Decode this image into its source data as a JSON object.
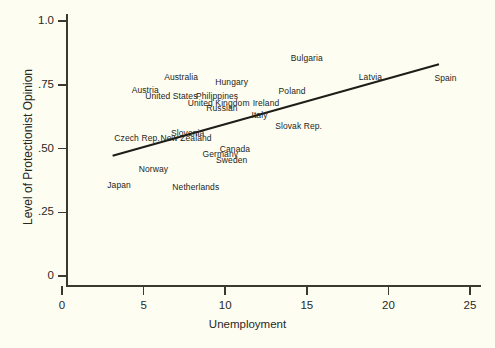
{
  "chart_data": {
    "type": "scatter",
    "title": "",
    "xlabel": "Unemployment",
    "ylabel": "Level of Protectionist Opinion",
    "xlim": [
      0,
      25
    ],
    "ylim": [
      0,
      1.0
    ],
    "xticks": [
      0,
      5,
      10,
      15,
      20,
      25
    ],
    "xtick_labels": [
      "0",
      "5",
      "10",
      "15",
      "20",
      "25"
    ],
    "yticks": [
      0,
      0.25,
      0.5,
      0.75,
      1.0
    ],
    "ytick_labels": [
      "0",
      ".25",
      ".50",
      ".75",
      "1.0"
    ],
    "grid": false,
    "legend": "none",
    "point_style": "text-labels-only",
    "points": [
      {
        "label": "Bulgaria",
        "x": 15.0,
        "y": 0.855
      },
      {
        "label": "Australia",
        "x": 7.3,
        "y": 0.78
      },
      {
        "label": "Hungary",
        "x": 10.4,
        "y": 0.76
      },
      {
        "label": "Latvia",
        "x": 18.9,
        "y": 0.78
      },
      {
        "label": "Spain",
        "x": 23.5,
        "y": 0.775
      },
      {
        "label": "Austria",
        "x": 5.1,
        "y": 0.73
      },
      {
        "label": "Poland",
        "x": 14.1,
        "y": 0.725
      },
      {
        "label": "United States",
        "x": 6.7,
        "y": 0.705
      },
      {
        "label": "Philippines",
        "x": 9.5,
        "y": 0.705
      },
      {
        "label": "United Kingdom",
        "x": 9.6,
        "y": 0.68
      },
      {
        "label": "Ireland",
        "x": 12.5,
        "y": 0.68
      },
      {
        "label": "Russian",
        "x": 9.8,
        "y": 0.66
      },
      {
        "label": "Italy",
        "x": 12.1,
        "y": 0.63
      },
      {
        "label": "Slovak Rep.",
        "x": 14.5,
        "y": 0.59
      },
      {
        "label": "Slovenia",
        "x": 7.7,
        "y": 0.56
      },
      {
        "label": "New Zealand",
        "x": 7.6,
        "y": 0.54
      },
      {
        "label": "Czech Rep.",
        "x": 4.6,
        "y": 0.54
      },
      {
        "label": "Canada",
        "x": 10.6,
        "y": 0.5
      },
      {
        "label": "Germany",
        "x": 9.7,
        "y": 0.478
      },
      {
        "label": "Sweden",
        "x": 10.4,
        "y": 0.455
      },
      {
        "label": "Norway",
        "x": 5.6,
        "y": 0.42
      },
      {
        "label": "Japan",
        "x": 3.5,
        "y": 0.355
      },
      {
        "label": "Netherlands",
        "x": 8.2,
        "y": 0.348
      }
    ],
    "trend_line": {
      "name": "fitted regression line",
      "x_start": 3.1,
      "y_start": 0.472,
      "x_end": 23.1,
      "y_end": 0.83
    }
  }
}
